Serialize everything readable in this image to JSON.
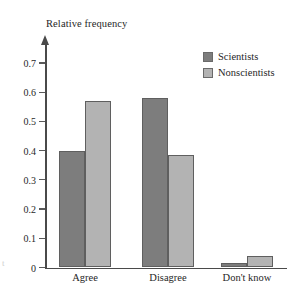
{
  "chart_data": {
    "type": "bar",
    "title": "",
    "ylabel": "Relative frequency",
    "xlabel": "",
    "categories": [
      "Agree",
      "Disagree",
      "Don't know"
    ],
    "series": [
      {
        "name": "Scientists",
        "color": "#7d7d7d",
        "values": [
          0.4,
          0.58,
          0.015
        ]
      },
      {
        "name": "Nonscientists",
        "color": "#b3b3b3",
        "values": [
          0.57,
          0.385,
          0.04
        ]
      }
    ],
    "ylim": [
      0,
      0.7
    ],
    "ytick_labels": [
      "0",
      "0.1",
      "0.2",
      "0.3",
      "0.4",
      "0.5",
      "0.6",
      "0.7"
    ],
    "ytick_values": [
      0,
      0.1,
      0.2,
      0.3,
      0.4,
      0.5,
      0.6,
      0.7
    ],
    "grid": false,
    "legend_position": "top-right",
    "background_color": "#ffffff",
    "axis_color": "#4a4a4a"
  },
  "edge_artifact": "t"
}
